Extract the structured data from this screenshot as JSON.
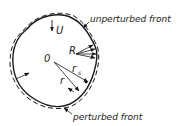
{
  "diagram": {
    "type": "front-perturbation-sketch",
    "colors": {
      "stroke": "#1a1a1a",
      "background": "#ffffff"
    },
    "labels": {
      "unperturbed_front": "unperturbed front",
      "perturbed_front": "perturbed front",
      "origin": "0",
      "velocity": "U",
      "radius_curvature": "R",
      "radius": "r",
      "radius_s_base": "r",
      "radius_s_sub": "s"
    },
    "legend": [
      {
        "line_style": "solid",
        "label": "unperturbed front"
      },
      {
        "line_style": "dashed",
        "label": "perturbed front"
      }
    ]
  }
}
